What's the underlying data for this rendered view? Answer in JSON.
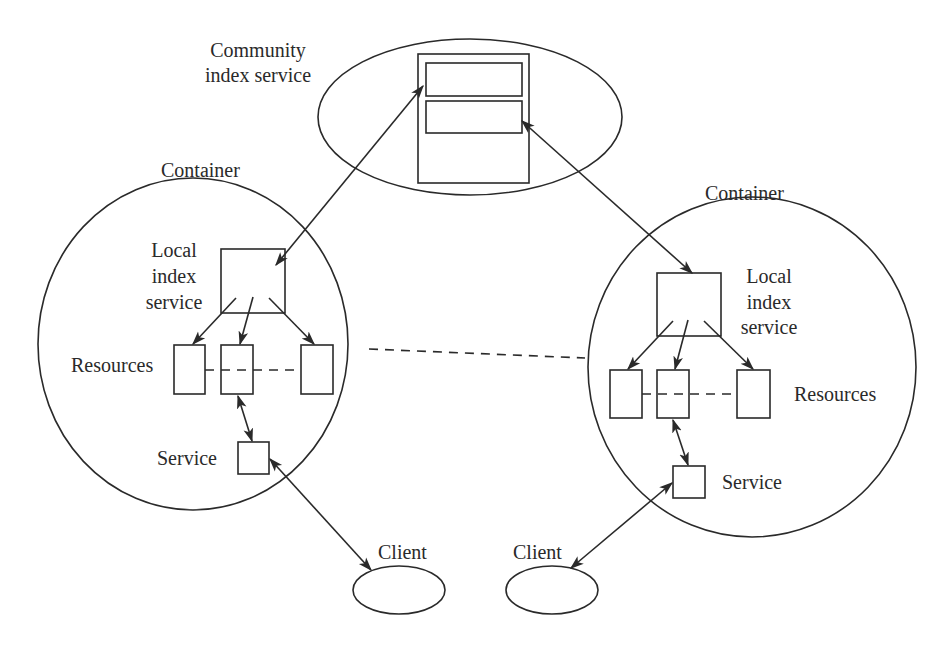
{
  "diagram": {
    "community": {
      "label_line1": "Community",
      "label_line2": "index service"
    },
    "left_container": {
      "title": "Container",
      "local_index_line1": "Local",
      "local_index_line2": "index",
      "local_index_line3": "service",
      "resources_label": "Resources",
      "service_label": "Service"
    },
    "right_container": {
      "title": "Container",
      "local_index_line1": "Local",
      "local_index_line2": "index",
      "local_index_line3": "service",
      "resources_label": "Resources",
      "service_label": "Service"
    },
    "clients": [
      {
        "label": "Client"
      },
      {
        "label": "Client"
      }
    ],
    "colors": {
      "stroke": "#2a2a2a",
      "background": "#ffffff"
    }
  }
}
